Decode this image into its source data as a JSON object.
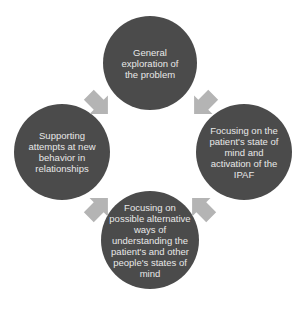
{
  "diagram": {
    "type": "cycle",
    "colors": {
      "node_fill": "#4b4b4b",
      "node_text": "#e8e8e8",
      "arrow_fill": "#b4b4b4"
    },
    "nodes": [
      {
        "id": "top",
        "label": "General exploration of the problem"
      },
      {
        "id": "right",
        "label": "Focusing on the patient's state of mind and activation of the IPAF"
      },
      {
        "id": "bottom",
        "label": "Focusing on possible alternative ways of understanding the patient's and other people's states of mind"
      },
      {
        "id": "left",
        "label": "Supporting attempts at new behavior in relationships"
      }
    ],
    "arrows": [
      {
        "from": "top",
        "to": "right",
        "direction": "clockwise"
      },
      {
        "from": "right",
        "to": "bottom",
        "direction": "clockwise"
      },
      {
        "from": "bottom",
        "to": "left",
        "direction": "clockwise"
      },
      {
        "from": "left",
        "to": "top",
        "direction": "clockwise"
      }
    ]
  }
}
